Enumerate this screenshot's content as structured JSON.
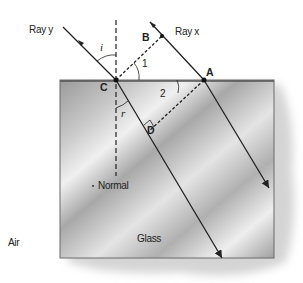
{
  "diagram": {
    "labels": {
      "ray_y": "Ray y",
      "ray_x": "Ray x",
      "point_a": "A",
      "point_b": "B",
      "point_c": "C",
      "point_d": "D",
      "angle_i": "i",
      "angle_r": "r",
      "angle_1": "1",
      "angle_2": "2",
      "normal": "Normal",
      "medium_air": "Air",
      "medium_glass": "Glass"
    },
    "colors": {
      "ray": "#222222",
      "glass_dark": "#8a8a8a",
      "glass_light": "#e6e6e6",
      "shadow": "#d8d8d8"
    }
  }
}
